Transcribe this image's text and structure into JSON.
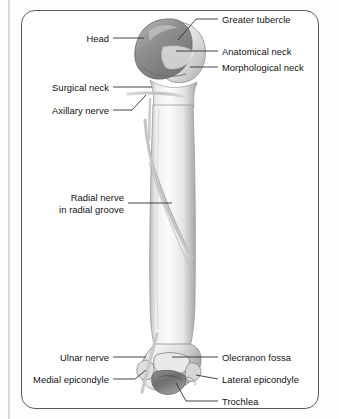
{
  "figure": {
    "frame": {
      "shape": "rounded-rectangle",
      "border_color": "#5a5a5a"
    },
    "palette": {
      "bone_light": "#f4f4f4",
      "bone_mid": "#cfcfcf",
      "bone_shadow": "#9a9a9a",
      "head_gray": "#8d8d8d",
      "nerve_gray": "#c8c8c8",
      "leader_line": "#333333",
      "text": "#111111"
    }
  },
  "labels": {
    "greater_tubercle": "Greater tubercle",
    "anatomical_neck": "Anatomical neck",
    "morphological_neck": "Morphological neck",
    "head": "Head",
    "surgical_neck": "Surgical neck",
    "axillary_nerve": "Axillary nerve",
    "radial_nerve_line1": "Radial nerve",
    "radial_nerve_line2": "in radial groove",
    "ulnar_nerve": "Ulnar nerve",
    "medial_epicondyle": "Medial epicondyle",
    "olecranon_fossa": "Olecranon fossa",
    "lateral_epicondyle": "Lateral epicondyle",
    "trochlea": "Trochlea"
  },
  "structures": [
    "humeral head",
    "greater tubercle",
    "anatomical neck",
    "morphological neck",
    "surgical neck",
    "humeral shaft",
    "radial groove",
    "medial epicondyle",
    "lateral epicondyle",
    "olecranon fossa",
    "trochlea"
  ],
  "nerves": [
    "axillary nerve",
    "radial nerve",
    "ulnar nerve"
  ]
}
